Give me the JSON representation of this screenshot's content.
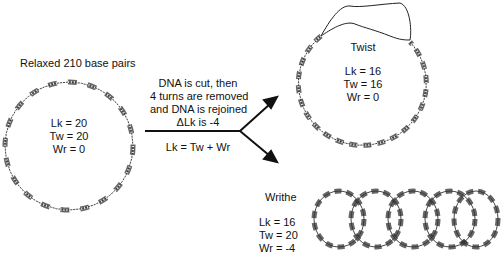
{
  "relaxed": {
    "title": "Relaxed 210 base pairs",
    "lk": "Lk = 20",
    "tw": "Tw = 20",
    "wr": "Wr = 0"
  },
  "process": {
    "line1": "DNA is cut, then",
    "line2": "4 turns are removed",
    "line3": "and DNA is rejoined",
    "delta": "ΔLk is -4",
    "equation": "Lk = Tw + Wr"
  },
  "twist": {
    "title": "Twist",
    "lk": "Lk = 16",
    "tw": "Tw = 16",
    "wr": "Wr = 0"
  },
  "writhe": {
    "title": "Writhe",
    "lk": "Lk = 16",
    "tw": "Tw = 20",
    "wr": "Wr = -4",
    "loops": 5
  }
}
